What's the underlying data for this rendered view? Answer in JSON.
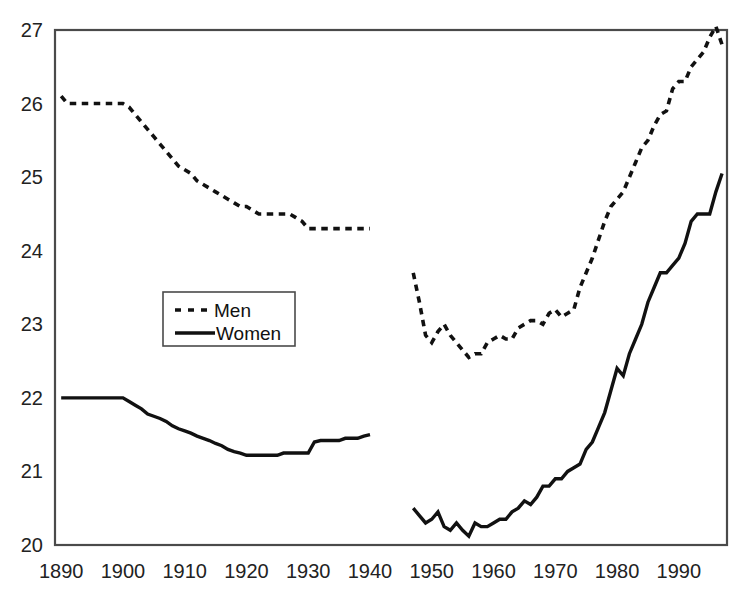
{
  "chart_data": {
    "type": "line",
    "title": "",
    "subtitle": "",
    "xlabel": "",
    "ylabel": "",
    "xlim": [
      1889,
      1997.8
    ],
    "ylim": [
      20,
      27
    ],
    "grid": false,
    "legend_position": "inside-left-middle",
    "xticks": [
      "1890",
      "1900",
      "1910",
      "1920",
      "1930",
      "1940",
      "1950",
      "1960",
      "1970",
      "1980",
      "1990"
    ],
    "xtick_values": [
      1890,
      1900,
      1910,
      1920,
      1930,
      1940,
      1950,
      1960,
      1970,
      1980,
      1990
    ],
    "yticks": [
      "20",
      "21",
      "22",
      "23",
      "24",
      "25",
      "26",
      "27"
    ],
    "ytick_values": [
      20,
      21,
      22,
      23,
      24,
      25,
      26,
      27
    ],
    "series": [
      {
        "name": "Men",
        "style": "dashed",
        "color": "#111111",
        "segments": [
          {
            "x": [
              1890,
              1891,
              1892,
              1893,
              1894,
              1895,
              1896,
              1897,
              1898,
              1899,
              1900,
              1901,
              1902,
              1903,
              1904,
              1905,
              1906,
              1907,
              1908,
              1909,
              1910,
              1911,
              1912,
              1913,
              1914,
              1915,
              1916,
              1917,
              1918,
              1919,
              1920,
              1921,
              1922,
              1923,
              1924,
              1925,
              1926,
              1927,
              1928,
              1929,
              1930,
              1931,
              1932,
              1933,
              1934,
              1935,
              1936,
              1937,
              1938,
              1939,
              1940
            ],
            "y": [
              26.1,
              26.0,
              26.0,
              26.0,
              26.0,
              26.0,
              26.0,
              26.0,
              26.0,
              26.0,
              26.0,
              25.95,
              25.85,
              25.75,
              25.65,
              25.55,
              25.45,
              25.35,
              25.25,
              25.15,
              25.1,
              25.05,
              24.95,
              24.9,
              24.85,
              24.8,
              24.75,
              24.7,
              24.65,
              24.6,
              24.6,
              24.55,
              24.5,
              24.5,
              24.5,
              24.5,
              24.5,
              24.5,
              24.45,
              24.4,
              24.3,
              24.3,
              24.3,
              24.3,
              24.3,
              24.3,
              24.3,
              24.3,
              24.3,
              24.3,
              24.3
            ]
          },
          {
            "x": [
              1947,
              1948,
              1949,
              1950,
              1951,
              1952,
              1953,
              1954,
              1955,
              1956,
              1957,
              1958,
              1959,
              1960,
              1961,
              1962,
              1963,
              1964,
              1965,
              1966,
              1967,
              1968,
              1969,
              1970,
              1971,
              1972,
              1973,
              1974,
              1975,
              1976,
              1977,
              1978,
              1979,
              1980,
              1981,
              1982,
              1983,
              1984,
              1985,
              1986,
              1987,
              1988,
              1989,
              1990,
              1991,
              1992,
              1993,
              1994,
              1995,
              1996,
              1997
            ],
            "y": [
              23.7,
              23.3,
              22.85,
              22.75,
              22.9,
              23.0,
              22.85,
              22.75,
              22.65,
              22.55,
              22.6,
              22.6,
              22.75,
              22.8,
              22.85,
              22.8,
              22.8,
              22.95,
              23.0,
              23.05,
              23.05,
              23.0,
              23.15,
              23.2,
              23.1,
              23.15,
              23.2,
              23.5,
              23.7,
              23.9,
              24.15,
              24.4,
              24.6,
              24.7,
              24.8,
              25.0,
              25.2,
              25.4,
              25.5,
              25.7,
              25.85,
              25.9,
              26.2,
              26.3,
              26.3,
              26.5,
              26.6,
              26.7,
              26.9,
              27.05,
              26.8
            ]
          }
        ]
      },
      {
        "name": "Women",
        "style": "solid",
        "color": "#111111",
        "segments": [
          {
            "x": [
              1890,
              1891,
              1892,
              1893,
              1894,
              1895,
              1896,
              1897,
              1898,
              1899,
              1900,
              1901,
              1902,
              1903,
              1904,
              1905,
              1906,
              1907,
              1908,
              1909,
              1910,
              1911,
              1912,
              1913,
              1914,
              1915,
              1916,
              1917,
              1918,
              1919,
              1920,
              1921,
              1922,
              1923,
              1924,
              1925,
              1926,
              1927,
              1928,
              1929,
              1930,
              1931,
              1932,
              1933,
              1934,
              1935,
              1936,
              1937,
              1938,
              1939,
              1940
            ],
            "y": [
              22.0,
              22.0,
              22.0,
              22.0,
              22.0,
              22.0,
              22.0,
              22.0,
              22.0,
              22.0,
              22.0,
              21.95,
              21.9,
              21.85,
              21.78,
              21.75,
              21.72,
              21.68,
              21.62,
              21.58,
              21.55,
              21.52,
              21.48,
              21.45,
              21.42,
              21.38,
              21.35,
              21.3,
              21.27,
              21.25,
              21.22,
              21.22,
              21.22,
              21.22,
              21.22,
              21.22,
              21.25,
              21.25,
              21.25,
              21.25,
              21.25,
              21.4,
              21.42,
              21.42,
              21.42,
              21.42,
              21.45,
              21.45,
              21.45,
              21.48,
              21.5
            ]
          },
          {
            "x": [
              1947,
              1948,
              1949,
              1950,
              1951,
              1952,
              1953,
              1954,
              1955,
              1956,
              1957,
              1958,
              1959,
              1960,
              1961,
              1962,
              1963,
              1964,
              1965,
              1966,
              1967,
              1968,
              1969,
              1970,
              1971,
              1972,
              1973,
              1974,
              1975,
              1976,
              1977,
              1978,
              1979,
              1980,
              1981,
              1982,
              1983,
              1984,
              1985,
              1986,
              1987,
              1988,
              1989,
              1990,
              1991,
              1992,
              1993,
              1994,
              1995,
              1996,
              1997
            ],
            "y": [
              20.5,
              20.4,
              20.3,
              20.35,
              20.45,
              20.25,
              20.2,
              20.3,
              20.2,
              20.12,
              20.3,
              20.25,
              20.25,
              20.3,
              20.35,
              20.35,
              20.45,
              20.5,
              20.6,
              20.55,
              20.65,
              20.8,
              20.8,
              20.9,
              20.9,
              21.0,
              21.05,
              21.1,
              21.3,
              21.4,
              21.6,
              21.8,
              22.1,
              22.4,
              22.3,
              22.6,
              22.8,
              23.0,
              23.3,
              23.5,
              23.7,
              23.7,
              23.8,
              23.9,
              24.1,
              24.4,
              24.5,
              24.5,
              24.5,
              24.8,
              25.05
            ]
          }
        ]
      }
    ]
  },
  "legend": {
    "entries": [
      {
        "label": "Men",
        "style": "dashed"
      },
      {
        "label": "Women",
        "style": "solid"
      }
    ]
  }
}
